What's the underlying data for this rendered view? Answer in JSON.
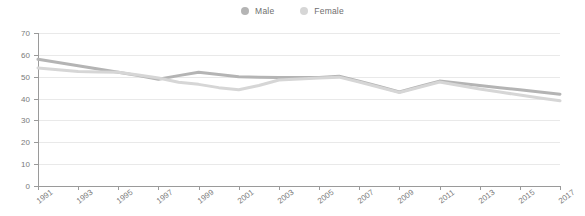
{
  "legend": {
    "position": "top-center",
    "items": [
      {
        "label": "Male",
        "color": "#b4b4b4",
        "icon": "circle-marker-icon"
      },
      {
        "label": "Female",
        "color": "#d6d6d6",
        "icon": "circle-marker-icon"
      }
    ]
  },
  "axes": {
    "y_ticks": [
      0,
      10,
      20,
      30,
      40,
      50,
      60,
      70
    ],
    "x_ticks": [
      "1991",
      "1993",
      "1995",
      "1997",
      "1999",
      "2001",
      "2003",
      "2005",
      "2007",
      "2009",
      "2011",
      "2013",
      "2015",
      "2017"
    ]
  },
  "chart_data": {
    "type": "line",
    "title": "",
    "subtitle": "",
    "xlabel": "",
    "ylabel": "",
    "ylim": [
      0,
      70
    ],
    "xlim": [
      "1991",
      "2017"
    ],
    "grid": true,
    "legend_position": "top-center",
    "categories": [
      "1991",
      "1992",
      "1993",
      "1994",
      "1995",
      "1996",
      "1997",
      "1998",
      "1999",
      "2000",
      "2001",
      "2002",
      "2003",
      "2004",
      "2005",
      "2006",
      "2007",
      "2008",
      "2009",
      "2010",
      "2011",
      "2012",
      "2013",
      "2014",
      "2015",
      "2016",
      "2017"
    ],
    "series": [
      {
        "name": "Male",
        "color": "#b4b4b4",
        "values": [
          58,
          56.5,
          55,
          53.5,
          52,
          50.5,
          48.8,
          50.5,
          52,
          51,
          50,
          49.8,
          49.6,
          49.6,
          49.6,
          50.2,
          48,
          45.5,
          43,
          45.5,
          48,
          47,
          46,
          45,
          44,
          43,
          42
        ]
      },
      {
        "name": "Female",
        "color": "#d6d6d6",
        "values": [
          54,
          53.2,
          52.4,
          52.2,
          52,
          50.8,
          49.4,
          47.5,
          46.5,
          45,
          44,
          46,
          48.5,
          49,
          49.4,
          49.8,
          47.6,
          45.2,
          42.8,
          45.2,
          47.6,
          46,
          44.4,
          43,
          41.6,
          40.3,
          39
        ]
      }
    ]
  }
}
